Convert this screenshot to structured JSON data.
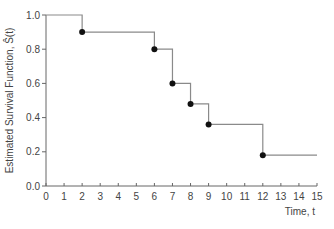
{
  "chart_data": {
    "type": "line",
    "subtype": "step",
    "title": "",
    "xlabel": "Time, t",
    "ylabel": "Estimated Survival Function, Ŝ(t)",
    "xlim": [
      0,
      15
    ],
    "ylim": [
      0.0,
      1.0
    ],
    "x_ticks": [
      0,
      1,
      2,
      3,
      4,
      5,
      6,
      7,
      8,
      9,
      10,
      11,
      12,
      13,
      14,
      15
    ],
    "y_ticks": [
      0.0,
      0.2,
      0.4,
      0.6,
      0.8,
      1.0
    ],
    "y_tick_labels": [
      "0.0",
      "0.2",
      "0.4",
      "0.6",
      "0.8",
      "1.0"
    ],
    "grid": false,
    "legend": null,
    "series": [
      {
        "name": "Kaplan-Meier estimate",
        "step_x": [
          0,
          2,
          6,
          7,
          8,
          9,
          12,
          15
        ],
        "step_y": [
          1.0,
          0.9,
          0.8,
          0.6,
          0.48,
          0.36,
          0.18,
          0.18
        ],
        "event_points": [
          {
            "x": 2,
            "y": 0.9
          },
          {
            "x": 6,
            "y": 0.8
          },
          {
            "x": 7,
            "y": 0.6
          },
          {
            "x": 8,
            "y": 0.48
          },
          {
            "x": 9,
            "y": 0.36
          },
          {
            "x": 12,
            "y": 0.18
          }
        ]
      }
    ],
    "colors": {
      "line": "#8a8a8a",
      "points": "#111111",
      "axis": "#666666",
      "text": "#444444"
    }
  }
}
